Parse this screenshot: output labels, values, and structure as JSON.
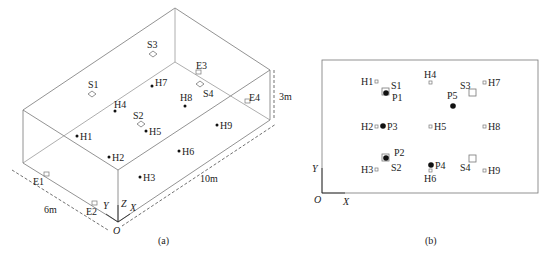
{
  "panel_a": {
    "caption": "(a)",
    "dims": {
      "width": "6m",
      "length": "10m",
      "height": "3m"
    },
    "axes": {
      "x": "X",
      "y": "Y",
      "z": "Z",
      "origin": "O"
    },
    "sources": [
      "S1",
      "S2",
      "S3",
      "S4"
    ],
    "exhausts": [
      "E1",
      "E2",
      "E3",
      "E4"
    ],
    "points": [
      "H1",
      "H2",
      "H3",
      "H4",
      "H5",
      "H6",
      "H7",
      "H8",
      "H9"
    ]
  },
  "panel_b": {
    "caption": "(b)",
    "axes": {
      "x": "X",
      "y": "Y",
      "origin": "O"
    },
    "h_points": [
      "H1",
      "H2",
      "H3",
      "H4",
      "H5",
      "H6",
      "H7",
      "H8",
      "H9"
    ],
    "sources": [
      "S1",
      "S2",
      "S3",
      "S4"
    ],
    "p_points": [
      "P1",
      "P2",
      "P3",
      "P4",
      "P5"
    ]
  }
}
